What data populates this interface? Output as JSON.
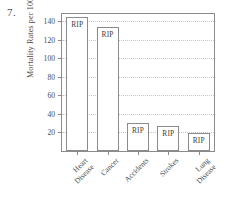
{
  "item_number": "7.",
  "chart_data": {
    "type": "bar",
    "title": "",
    "xlabel": "",
    "ylabel": "Mortality Rates per 100,000",
    "categories": [
      "Heart Disease",
      "Cancer",
      "Accidents",
      "Strokes",
      "Lung Disease"
    ],
    "category_lines": [
      [
        "Heart",
        "Disease"
      ],
      [
        "Cancer"
      ],
      [
        "Accidents"
      ],
      [
        "Strokes"
      ],
      [
        "Lung",
        "Disease"
      ]
    ],
    "values": [
      145,
      134,
      30,
      27,
      19
    ],
    "bar_labels": [
      "RIP",
      "RIP",
      "RIP",
      "RIP",
      "RIP"
    ],
    "ylim": [
      0,
      148
    ],
    "yticks": [
      20,
      40,
      60,
      80,
      100,
      120,
      140
    ],
    "ytick_labels": [
      "20",
      "40",
      "60",
      "80",
      "100",
      "120",
      "140"
    ],
    "grid": true,
    "legend": "none",
    "bar_fill_color": "#ffffff",
    "bar_edge_color": "#8b8b8b",
    "axis_color": "#8b8b8b",
    "grid_color": "#c4c4c4",
    "text_color": "#4a4a4a"
  }
}
